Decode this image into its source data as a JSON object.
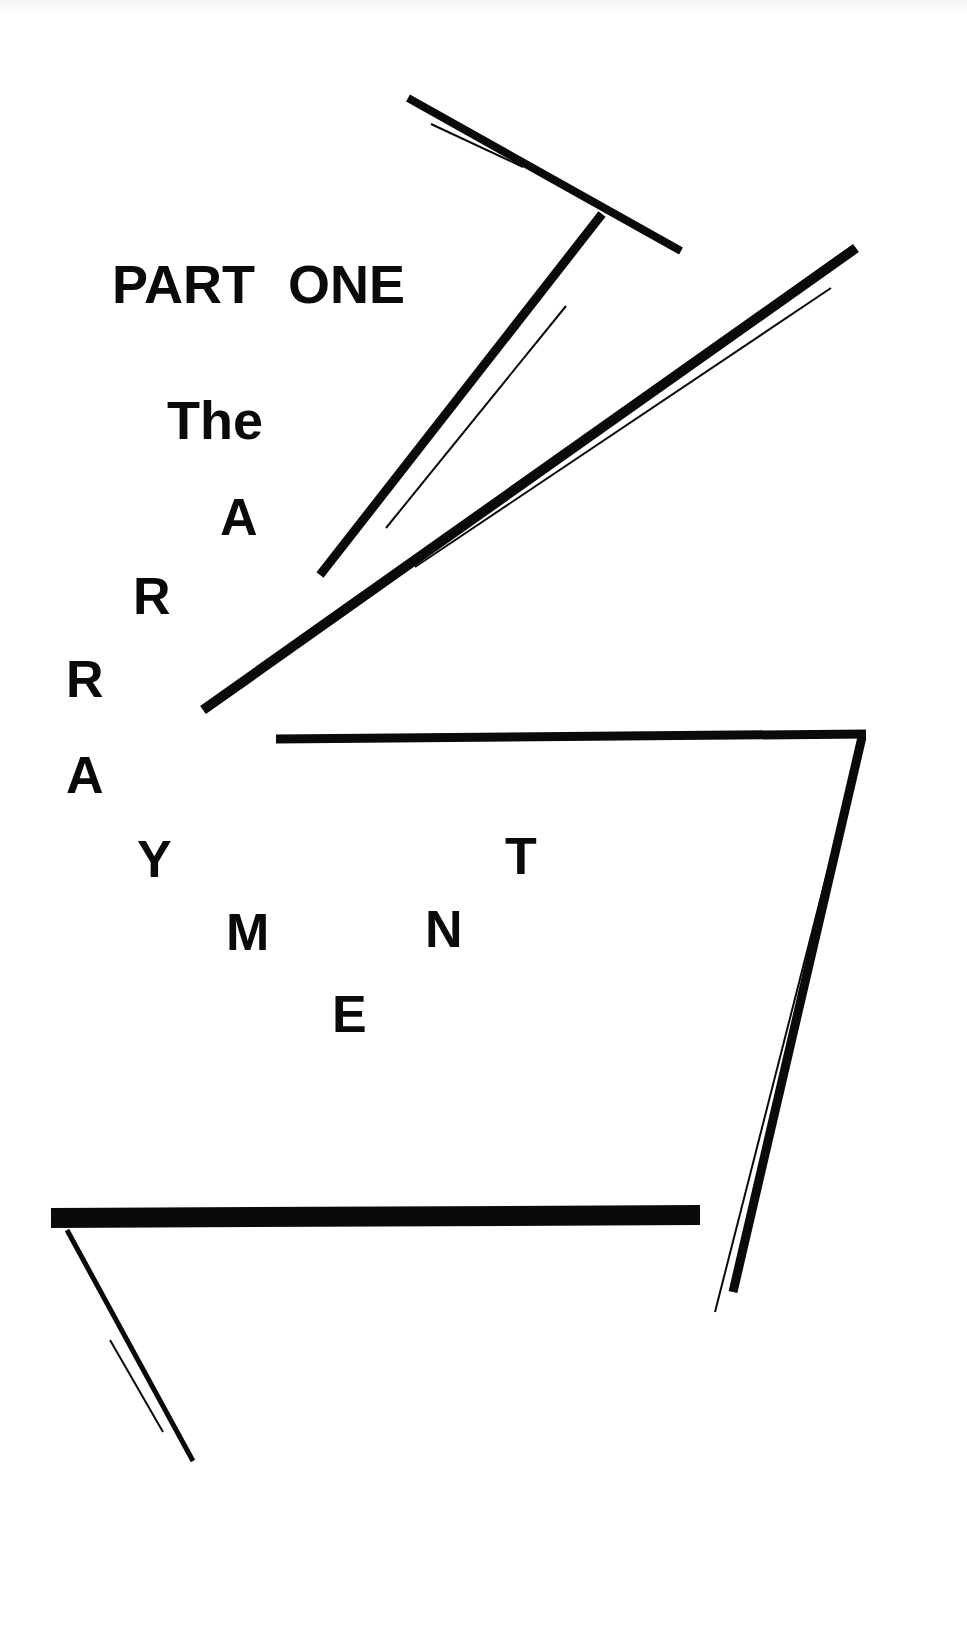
{
  "page": {
    "part_label": "PART ONE",
    "title_prefix": "The",
    "title_letters": [
      {
        "char": "A",
        "x": 220,
        "y": 535
      },
      {
        "char": "R",
        "x": 133,
        "y": 614
      },
      {
        "char": "R",
        "x": 66,
        "y": 697
      },
      {
        "char": "A",
        "x": 66,
        "y": 793
      },
      {
        "char": "Y",
        "x": 137,
        "y": 877
      },
      {
        "char": "M",
        "x": 226,
        "y": 950
      },
      {
        "char": "E",
        "x": 332,
        "y": 1032
      },
      {
        "char": "N",
        "x": 425,
        "y": 947
      },
      {
        "char": "T",
        "x": 505,
        "y": 874
      }
    ],
    "title_word": "ARRAYMENT",
    "ink_color": "#0a0a0a",
    "background_color": "#ffffff"
  }
}
